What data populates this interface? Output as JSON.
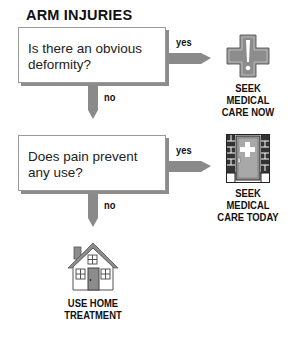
{
  "title": "ARM INJURIES",
  "nodes": [
    {
      "question": "Is there an obvious deformity?",
      "yes_label": "yes",
      "no_label": "no",
      "outcome_yes": {
        "icon": "medical-cross-exclamation-icon",
        "lines": [
          "SEEK",
          "MEDICAL",
          "CARE NOW"
        ]
      }
    },
    {
      "question": "Does pain prevent any use?",
      "yes_label": "yes",
      "no_label": "no",
      "outcome_yes": {
        "icon": "clinic-door-icon",
        "lines": [
          "SEEK",
          "MEDICAL",
          "CARE TODAY"
        ]
      }
    }
  ],
  "final_outcome": {
    "icon": "house-icon",
    "lines": [
      "USE HOME",
      "TREATMENT"
    ]
  },
  "colors": {
    "arrow": "#8a8a8a",
    "icon_fill": "#8c8c8c",
    "box_border": "#9a9a9a",
    "shadow": "#8c8c8c"
  }
}
